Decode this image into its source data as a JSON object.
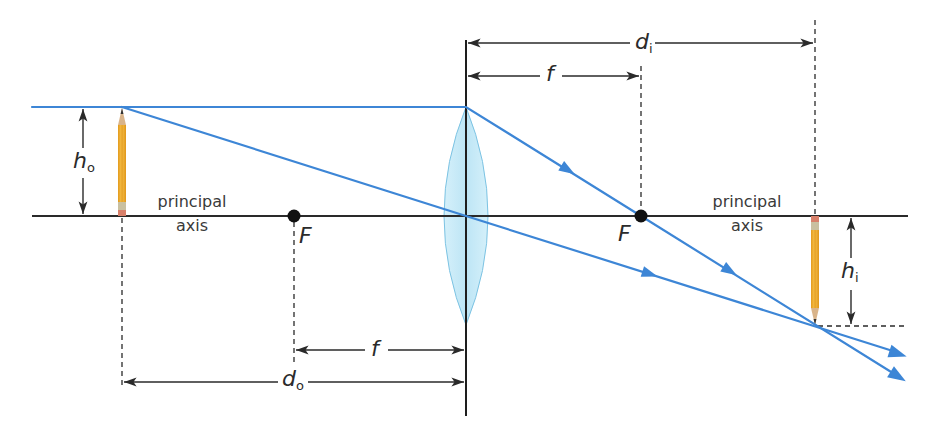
{
  "diagram": {
    "colors": {
      "ray": "#3d86d6",
      "axis": "#2a2a2a",
      "lens_fill": "#bfe6f5",
      "lens_stroke": "#7cc3e3",
      "pencil_body": "#f2b233",
      "focal_point": "#111111"
    },
    "labels": {
      "principal_axis_left": [
        "principal",
        "axis"
      ],
      "principal_axis_right": [
        "principal",
        "axis"
      ],
      "focal_left": "F",
      "focal_right": "F",
      "object_height": {
        "symbol": "h",
        "subscript": "o"
      },
      "image_height": {
        "symbol": "h",
        "subscript": "i"
      },
      "object_distance": {
        "symbol": "d",
        "subscript": "o"
      },
      "image_distance": {
        "symbol": "d",
        "subscript": "i"
      },
      "focal_length_top": "f",
      "focal_length_bottom": "f"
    },
    "elements": {
      "principal_axis": {
        "x1": 32,
        "x2": 908,
        "y": 216
      },
      "lens": {
        "x": 466,
        "top": 107,
        "bottom": 325,
        "half_width": 22
      },
      "lens_axis_line": {
        "x": 466,
        "y1": 40,
        "y2": 416
      },
      "object": {
        "x": 122,
        "top": 107,
        "bottom": 216
      },
      "image": {
        "x": 815,
        "top": 216,
        "bottom": 326
      },
      "focal_points": [
        {
          "x": 294,
          "y": 216
        },
        {
          "x": 641,
          "y": 216
        }
      ],
      "rays": [
        {
          "name": "parallel-ray",
          "points": [
            [
              32,
              107
            ],
            [
              466,
              107
            ],
            [
              641,
              216
            ],
            [
              905,
              381
            ]
          ]
        },
        {
          "name": "central-ray",
          "points": [
            [
              122,
              107
            ],
            [
              466,
              216
            ],
            [
              905,
              355
            ]
          ]
        }
      ]
    }
  }
}
